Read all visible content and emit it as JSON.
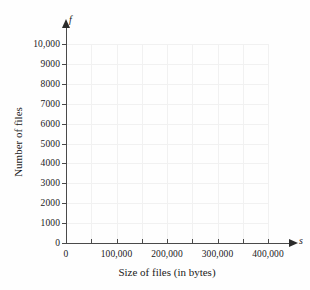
{
  "chart_data": {
    "type": "scatter",
    "title": "",
    "subtitle": "",
    "xlabel": "Size of files (in bytes)",
    "ylabel": "Number of files",
    "x_variable": "s",
    "y_variable": "f",
    "xlim": [
      0,
      400000
    ],
    "ylim": [
      0,
      10000
    ],
    "x_major_step": 100000,
    "x_minor_step": 50000,
    "y_step": 1000,
    "grid": true,
    "grid_color": "#f1f1f1",
    "axis_color": "#4a4a4a",
    "legend": null,
    "series": [],
    "annotations": [],
    "x_tick_labels": [
      "0",
      "100,000",
      "200,000",
      "300,000",
      "400,000"
    ],
    "x_tick_values": [
      0,
      100000,
      200000,
      300000,
      400000
    ],
    "y_tick_labels": [
      "0",
      "1000",
      "2000",
      "3000",
      "4000",
      "5000",
      "6000",
      "7000",
      "8000",
      "9000",
      "10,000"
    ],
    "y_tick_values": [
      0,
      1000,
      2000,
      3000,
      4000,
      5000,
      6000,
      7000,
      8000,
      9000,
      10000
    ],
    "x_minor_tick_values": [
      0,
      50000,
      100000,
      150000,
      200000,
      250000,
      300000,
      350000,
      400000
    ],
    "values": [],
    "note": "Empty coordinate grid with no plotted data"
  }
}
